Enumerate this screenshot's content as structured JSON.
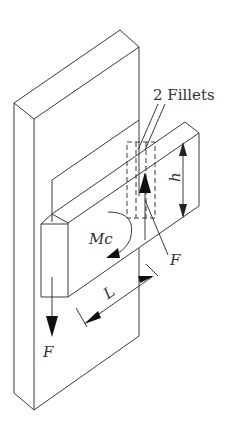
{
  "figure": {
    "labels": {
      "fillets": "2 Fillets",
      "moment": "Mc",
      "force_bottom": "F",
      "force_right": "F",
      "length": "L",
      "height": "h"
    },
    "colors": {
      "stroke": "#3a3a3a",
      "background": "#ffffff"
    }
  }
}
